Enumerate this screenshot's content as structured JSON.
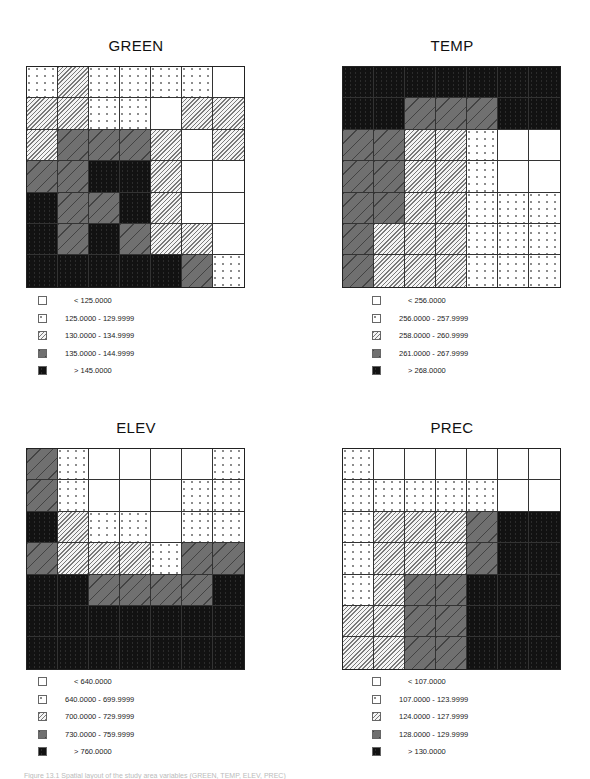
{
  "chart_data": [
    {
      "type": "heatmap",
      "title": "GREEN",
      "grid_size": [
        7,
        7
      ],
      "classes": [
        "< 125.0000",
        "125.0000 - 129.9999",
        "130.0000 - 134.9999",
        "135.0000 - 144.9999",
        "> 145.0000"
      ],
      "cells": [
        [
          1,
          2,
          1,
          1,
          1,
          1,
          0
        ],
        [
          2,
          2,
          1,
          1,
          0,
          2,
          2
        ],
        [
          2,
          3,
          3,
          3,
          2,
          0,
          2
        ],
        [
          3,
          3,
          4,
          4,
          2,
          0,
          0
        ],
        [
          4,
          3,
          3,
          4,
          2,
          0,
          0
        ],
        [
          4,
          3,
          4,
          3,
          2,
          2,
          0
        ],
        [
          4,
          4,
          4,
          4,
          4,
          3,
          1
        ]
      ]
    },
    {
      "type": "heatmap",
      "title": "TEMP",
      "grid_size": [
        7,
        7
      ],
      "classes": [
        "< 256.0000",
        "256.0000 - 257.9999",
        "258.0000 - 260.9999",
        "261.0000 - 267.9999",
        "> 268.0000"
      ],
      "cells": [
        [
          4,
          4,
          4,
          4,
          4,
          4,
          4
        ],
        [
          4,
          4,
          3,
          3,
          3,
          4,
          4
        ],
        [
          3,
          3,
          2,
          2,
          1,
          0,
          0
        ],
        [
          3,
          3,
          2,
          2,
          1,
          0,
          0
        ],
        [
          3,
          3,
          2,
          2,
          1,
          1,
          1
        ],
        [
          3,
          2,
          2,
          2,
          1,
          1,
          1
        ],
        [
          3,
          2,
          2,
          2,
          1,
          1,
          1
        ]
      ]
    },
    {
      "type": "heatmap",
      "title": "ELEV",
      "grid_size": [
        7,
        7
      ],
      "classes": [
        "< 640.0000",
        "640.0000 - 699.9999",
        "700.0000 - 729.9999",
        "730.0000 - 759.9999",
        "> 760.0000"
      ],
      "cells": [
        [
          3,
          1,
          0,
          0,
          0,
          0,
          1
        ],
        [
          3,
          1,
          0,
          0,
          0,
          1,
          1
        ],
        [
          4,
          2,
          1,
          1,
          0,
          1,
          1
        ],
        [
          3,
          2,
          2,
          2,
          1,
          3,
          3
        ],
        [
          4,
          4,
          3,
          3,
          3,
          3,
          4
        ],
        [
          4,
          4,
          4,
          4,
          4,
          4,
          4
        ],
        [
          4,
          4,
          4,
          4,
          4,
          4,
          4
        ]
      ]
    },
    {
      "type": "heatmap",
      "title": "PREC",
      "grid_size": [
        7,
        7
      ],
      "classes": [
        "< 107.0000",
        "107.0000 - 123.9999",
        "124.0000 - 127.9999",
        "128.0000 - 129.9999",
        "> 130.0000"
      ],
      "cells": [
        [
          1,
          0,
          0,
          0,
          0,
          0,
          0
        ],
        [
          1,
          1,
          1,
          1,
          1,
          0,
          0
        ],
        [
          1,
          2,
          2,
          2,
          3,
          4,
          4
        ],
        [
          1,
          2,
          2,
          2,
          3,
          4,
          4
        ],
        [
          1,
          2,
          3,
          3,
          4,
          4,
          4
        ],
        [
          2,
          2,
          3,
          3,
          4,
          4,
          4
        ],
        [
          2,
          2,
          3,
          3,
          4,
          4,
          4
        ]
      ]
    }
  ],
  "panels": [
    {
      "title": "GREEN",
      "legend": [
        "< 125.0000",
        "125.0000 - 129.9999",
        "130.0000 - 134.9999",
        "135.0000 - 144.9999",
        "> 145.0000"
      ]
    },
    {
      "title": "TEMP",
      "legend": [
        "< 256.0000",
        "256.0000 - 257.9999",
        "258.0000 - 260.9999",
        "261.0000 - 267.9999",
        "> 268.0000"
      ]
    },
    {
      "title": "ELEV",
      "legend": [
        "< 640.0000",
        "640.0000 - 699.9999",
        "700.0000 - 729.9999",
        "730.0000 - 759.9999",
        "> 760.0000"
      ]
    },
    {
      "title": "PREC",
      "legend": [
        "< 107.0000",
        "107.0000 - 123.9999",
        "124.0000 - 127.9999",
        "128.0000 - 129.9999",
        "> 130.0000"
      ]
    }
  ],
  "legend_fills": [
    "white",
    "dots",
    "hatch",
    "dark-gray",
    "black"
  ],
  "colors": {
    "white": "#ffffff",
    "hatch": "#a8a8a8",
    "dark_gray": "#707070",
    "black": "#121212"
  },
  "caption": "Figure 13.1  Spatial layout of the study area variables (GREEN, TEMP, ELEV, PREC)"
}
